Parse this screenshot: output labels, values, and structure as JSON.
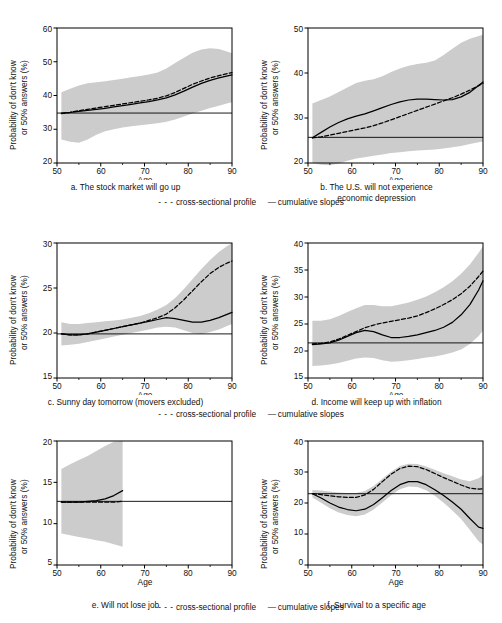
{
  "figure": {
    "y_axis_label_line1": "Probability of don't know",
    "y_axis_label_line2": "or 50% answers (%)",
    "x_axis_label": "Age",
    "legend_dash_glyph": "- - -",
    "legend_dash_label": "cross-sectional profile",
    "legend_solid_glyph": "—",
    "legend_solid_label": "cumulative slopes",
    "shading_color": "#cccccc",
    "line_color": "#000000"
  },
  "chart_data": [
    {
      "id": "a",
      "type": "line",
      "title": "a. The stock market will go up",
      "xlabel": "Age",
      "ylabel": "Probability of don't know or 50% answers (%)",
      "xlim": [
        50,
        90
      ],
      "ylim": [
        20,
        60
      ],
      "xticks": [
        50,
        60,
        70,
        80,
        90
      ],
      "yticks": [
        20,
        30,
        40,
        50,
        60
      ],
      "grid": false,
      "legend_position": "below-figure",
      "reference_line_y": 34.8,
      "x": [
        51,
        53,
        55,
        57,
        59,
        61,
        63,
        65,
        67,
        69,
        71,
        73,
        75,
        77,
        79,
        81,
        83,
        85,
        87,
        89,
        90
      ],
      "series": [
        {
          "name": "cross-sectional profile",
          "style": "dashed",
          "values": [
            34.6,
            35.0,
            35.5,
            35.9,
            36.3,
            36.7,
            37.1,
            37.5,
            37.9,
            38.3,
            38.7,
            39.2,
            39.9,
            40.9,
            42.1,
            43.3,
            44.3,
            45.2,
            45.9,
            46.5,
            46.8
          ]
        },
        {
          "name": "cumulative slopes",
          "style": "solid",
          "values": [
            34.8,
            35.0,
            35.3,
            35.6,
            35.9,
            36.2,
            36.6,
            37.0,
            37.4,
            37.8,
            38.2,
            38.7,
            39.3,
            40.2,
            41.3,
            42.5,
            43.6,
            44.5,
            45.2,
            45.8,
            46.1
          ]
        },
        {
          "name": "confidence band upper",
          "style": "band",
          "values": [
            41.0,
            42.0,
            43.0,
            43.6,
            43.9,
            44.2,
            44.6,
            45.0,
            45.4,
            45.8,
            46.2,
            46.8,
            48.0,
            49.6,
            51.2,
            52.7,
            53.6,
            54.0,
            53.8,
            53.0,
            52.5
          ]
        },
        {
          "name": "confidence band lower",
          "style": "band",
          "values": [
            27.0,
            26.3,
            26.0,
            27.0,
            28.4,
            29.4,
            30.0,
            30.5,
            30.9,
            31.2,
            31.5,
            31.8,
            32.2,
            32.9,
            33.8,
            34.7,
            35.5,
            36.3,
            37.0,
            37.7,
            38.0
          ]
        }
      ]
    },
    {
      "id": "b",
      "type": "line",
      "title_line1": "b. The U.S. will not experience",
      "title_line2": "economic depression",
      "title": "b. The U.S. will not experience economic depression",
      "xlabel": "Age",
      "ylabel": "Probability of don't know or 50% answers (%)",
      "xlim": [
        50,
        90
      ],
      "ylim": [
        20,
        50
      ],
      "xticks": [
        50,
        60,
        70,
        80,
        90
      ],
      "yticks": [
        20,
        30,
        40,
        50
      ],
      "grid": false,
      "legend_position": "below-figure",
      "reference_line_y": 25.7,
      "x": [
        51,
        53,
        55,
        57,
        59,
        61,
        63,
        65,
        67,
        69,
        71,
        73,
        75,
        77,
        79,
        81,
        83,
        85,
        87,
        89,
        90
      ],
      "series": [
        {
          "name": "cross-sectional profile",
          "style": "dashed",
          "values": [
            25.6,
            25.8,
            26.2,
            26.6,
            27.0,
            27.4,
            27.8,
            28.3,
            28.9,
            29.6,
            30.3,
            31.0,
            31.7,
            32.4,
            33.1,
            33.8,
            34.5,
            35.3,
            36.2,
            37.2,
            37.7
          ]
        },
        {
          "name": "cumulative slopes",
          "style": "solid",
          "values": [
            25.6,
            26.8,
            28.0,
            29.0,
            29.8,
            30.4,
            30.9,
            31.6,
            32.3,
            33.0,
            33.6,
            34.0,
            34.2,
            34.2,
            34.1,
            34.0,
            34.1,
            34.7,
            35.7,
            37.2,
            38.0
          ]
        },
        {
          "name": "confidence band upper",
          "style": "band",
          "values": [
            33.2,
            34.0,
            34.8,
            35.8,
            36.8,
            37.8,
            38.3,
            38.6,
            39.3,
            40.2,
            41.0,
            41.6,
            42.0,
            42.3,
            42.8,
            44.0,
            45.4,
            46.7,
            47.6,
            48.2,
            48.5
          ]
        },
        {
          "name": "confidence band lower",
          "style": "band",
          "values": [
            20.0,
            19.6,
            19.5,
            19.9,
            20.5,
            21.0,
            21.3,
            21.6,
            21.9,
            22.2,
            22.4,
            22.6,
            22.8,
            22.9,
            23.0,
            23.2,
            23.5,
            23.8,
            24.2,
            24.6,
            24.8
          ]
        }
      ]
    },
    {
      "id": "c",
      "type": "line",
      "title": "c. Sunny day tomorrow (movers excluded)",
      "xlabel": "Age",
      "ylabel": "Probability of don't know or 50% answers (%)",
      "xlim": [
        50,
        90
      ],
      "ylim": [
        15,
        30
      ],
      "xticks": [
        50,
        60,
        70,
        80,
        90
      ],
      "yticks": [
        15,
        20,
        25,
        30
      ],
      "grid": false,
      "legend_position": "below-figure",
      "reference_line_y": 19.9,
      "x": [
        51,
        53,
        55,
        57,
        59,
        61,
        63,
        65,
        67,
        69,
        71,
        73,
        75,
        77,
        79,
        81,
        83,
        85,
        87,
        89,
        90
      ],
      "series": [
        {
          "name": "cross-sectional profile",
          "style": "dashed",
          "values": [
            19.9,
            19.8,
            19.8,
            19.9,
            20.1,
            20.3,
            20.5,
            20.7,
            20.9,
            21.1,
            21.4,
            21.7,
            22.1,
            22.8,
            23.7,
            24.7,
            25.7,
            26.6,
            27.3,
            27.8,
            28.0
          ]
        },
        {
          "name": "cumulative slopes",
          "style": "solid",
          "values": [
            19.9,
            19.8,
            19.8,
            19.9,
            20.1,
            20.3,
            20.5,
            20.7,
            20.9,
            21.1,
            21.3,
            21.5,
            21.7,
            21.6,
            21.4,
            21.2,
            21.2,
            21.4,
            21.7,
            22.1,
            22.3
          ]
        },
        {
          "name": "confidence band upper",
          "style": "band",
          "values": [
            21.2,
            21.0,
            21.0,
            21.1,
            21.2,
            21.3,
            21.4,
            21.5,
            21.7,
            21.9,
            22.2,
            22.6,
            23.1,
            23.9,
            24.9,
            26.0,
            27.1,
            28.1,
            29.0,
            29.7,
            30.0
          ]
        },
        {
          "name": "confidence band lower",
          "style": "band",
          "values": [
            18.6,
            18.7,
            18.8,
            19.0,
            19.2,
            19.4,
            19.6,
            19.8,
            20.0,
            20.2,
            20.4,
            20.6,
            20.7,
            20.6,
            20.3,
            20.0,
            19.9,
            20.1,
            20.4,
            20.8,
            21.0
          ]
        }
      ]
    },
    {
      "id": "d",
      "type": "line",
      "title": "d. Income will keep up with inflation",
      "xlabel": "Age",
      "ylabel": "Probability of don't know or 50% answers (%)",
      "xlim": [
        50,
        90
      ],
      "ylim": [
        15,
        40
      ],
      "xticks": [
        50,
        60,
        70,
        80,
        90
      ],
      "yticks": [
        15,
        20,
        25,
        30,
        35,
        40
      ],
      "grid": false,
      "legend_position": "below-figure",
      "reference_line_y": 21.5,
      "x": [
        51,
        53,
        55,
        57,
        59,
        61,
        63,
        65,
        67,
        69,
        71,
        73,
        75,
        77,
        79,
        81,
        83,
        85,
        87,
        89,
        90
      ],
      "series": [
        {
          "name": "cross-sectional profile",
          "style": "dashed",
          "values": [
            21.3,
            21.4,
            21.7,
            22.2,
            22.9,
            23.6,
            24.3,
            24.8,
            25.2,
            25.5,
            25.8,
            26.1,
            26.5,
            27.1,
            27.8,
            28.6,
            29.5,
            30.6,
            32.0,
            33.8,
            34.8
          ]
        },
        {
          "name": "cumulative slopes",
          "style": "solid",
          "values": [
            21.2,
            21.3,
            21.5,
            22.0,
            22.7,
            23.4,
            23.8,
            23.6,
            23.0,
            22.5,
            22.5,
            22.7,
            23.0,
            23.4,
            23.8,
            24.4,
            25.3,
            26.7,
            28.6,
            31.3,
            33.0
          ]
        },
        {
          "name": "confidence band upper",
          "style": "band",
          "values": [
            25.6,
            25.6,
            25.9,
            26.5,
            27.2,
            27.9,
            28.5,
            28.5,
            28.3,
            28.3,
            28.6,
            29.0,
            29.5,
            30.1,
            30.9,
            31.8,
            32.9,
            34.3,
            36.0,
            38.2,
            39.4
          ]
        },
        {
          "name": "confidence band lower",
          "style": "band",
          "values": [
            17.2,
            17.3,
            17.5,
            17.8,
            18.2,
            18.6,
            18.8,
            18.7,
            18.3,
            18.0,
            18.1,
            18.3,
            18.5,
            18.8,
            19.0,
            19.3,
            19.7,
            20.3,
            21.3,
            22.8,
            23.8
          ]
        }
      ]
    },
    {
      "id": "e",
      "type": "line",
      "title": "e. Will not lose job",
      "xlabel": "Age",
      "ylabel": "Probability of don't know or 50% answers (%)",
      "xlim": [
        50,
        90
      ],
      "ylim": [
        5,
        20
      ],
      "xticks": [
        50,
        60,
        70,
        80,
        90
      ],
      "yticks": [
        5,
        10,
        15,
        20
      ],
      "grid": false,
      "legend_position": "below-figure",
      "reference_line_y": 12.7,
      "x": [
        51,
        53,
        55,
        57,
        59,
        61,
        63,
        65
      ],
      "series": [
        {
          "name": "cross-sectional profile",
          "style": "dashed",
          "values": [
            12.6,
            12.6,
            12.6,
            12.6,
            12.6,
            12.6,
            12.6,
            12.7
          ]
        },
        {
          "name": "cumulative slopes",
          "style": "solid",
          "values": [
            12.6,
            12.6,
            12.6,
            12.7,
            12.8,
            13.0,
            13.4,
            14.0
          ]
        },
        {
          "name": "confidence band upper",
          "style": "band",
          "values": [
            16.6,
            17.2,
            17.7,
            18.2,
            18.8,
            19.4,
            19.9,
            20.0
          ]
        },
        {
          "name": "confidence band lower",
          "style": "band",
          "values": [
            8.8,
            8.6,
            8.4,
            8.2,
            8.0,
            7.8,
            7.5,
            7.2
          ]
        }
      ]
    },
    {
      "id": "f",
      "type": "line",
      "title": "f. Survival to a specific age",
      "xlabel": "Age",
      "ylabel": "Probability of don't know or 50% answers (%)",
      "xlim": [
        50,
        90
      ],
      "ylim": [
        0,
        40
      ],
      "xticks": [
        50,
        60,
        70,
        80,
        90
      ],
      "yticks": [
        0,
        10,
        20,
        30,
        40
      ],
      "grid": false,
      "legend_position": "below-figure",
      "reference_line_y": 23.0,
      "x": [
        51,
        53,
        55,
        57,
        59,
        61,
        63,
        65,
        67,
        69,
        71,
        73,
        75,
        77,
        79,
        81,
        83,
        85,
        87,
        89,
        90
      ],
      "series": [
        {
          "name": "cross-sectional profile",
          "style": "dashed",
          "values": [
            23.0,
            22.7,
            22.3,
            22.0,
            21.8,
            21.8,
            22.6,
            24.4,
            26.9,
            29.3,
            31.1,
            31.9,
            31.7,
            30.8,
            29.5,
            28.2,
            27.0,
            25.8,
            24.8,
            24.5,
            24.6
          ]
        },
        {
          "name": "cumulative slopes",
          "style": "solid",
          "values": [
            23.0,
            21.6,
            20.0,
            18.7,
            17.9,
            17.5,
            18.0,
            19.5,
            21.7,
            24.0,
            25.9,
            26.9,
            26.9,
            25.9,
            24.3,
            22.4,
            20.3,
            18.0,
            15.0,
            12.2,
            11.8
          ]
        },
        {
          "name": "confidence band upper",
          "style": "band",
          "values": [
            24.2,
            24.0,
            23.7,
            23.4,
            23.2,
            23.2,
            23.9,
            25.5,
            27.8,
            30.1,
            31.9,
            32.7,
            32.6,
            31.8,
            30.7,
            29.6,
            28.6,
            27.6,
            27.0,
            28.0,
            29.0
          ]
        },
        {
          "name": "confidence band lower",
          "style": "band",
          "values": [
            21.8,
            20.1,
            18.3,
            16.9,
            16.1,
            15.7,
            16.3,
            17.9,
            20.2,
            22.5,
            24.4,
            25.3,
            25.2,
            24.1,
            22.3,
            20.1,
            17.6,
            14.8,
            11.3,
            7.7,
            6.5
          ]
        }
      ]
    }
  ]
}
